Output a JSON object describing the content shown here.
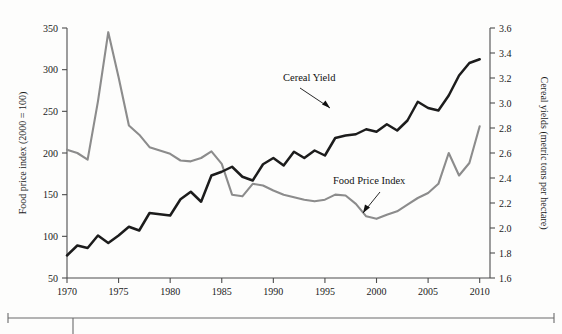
{
  "chart_data": {
    "type": "line",
    "title": "",
    "xlabel": "",
    "grid": false,
    "legend_position": "inline-annotations",
    "x": [
      1970,
      1971,
      1972,
      1973,
      1974,
      1975,
      1976,
      1977,
      1978,
      1979,
      1980,
      1981,
      1982,
      1983,
      1984,
      1985,
      1986,
      1987,
      1988,
      1989,
      1990,
      1991,
      1992,
      1993,
      1994,
      1995,
      1996,
      1997,
      1998,
      1999,
      2000,
      2001,
      2002,
      2003,
      2004,
      2005,
      2006,
      2007,
      2008,
      2009,
      2010
    ],
    "xlim": [
      1970,
      2011
    ],
    "xticks": [
      1970,
      1975,
      1980,
      1985,
      1990,
      1995,
      2000,
      2005,
      2010
    ],
    "left_axis": {
      "label": "Food price index (2000 = 100)",
      "ticks": [
        50,
        100,
        150,
        200,
        250,
        300,
        350
      ],
      "lim": [
        50,
        350
      ]
    },
    "right_axis": {
      "label": "Cereal yields (metric tons per hectare)",
      "ticks": [
        "1.6",
        "1.8",
        "2.0",
        "2.2",
        "2.4",
        "2.6",
        "2.8",
        "3.0",
        "3.2",
        "3.4",
        "3.6"
      ],
      "lim": [
        1.6,
        3.6
      ]
    },
    "series": [
      {
        "name": "Food Price Index",
        "axis": "left",
        "color": "#8c8c8c",
        "values": [
          204,
          200,
          192,
          262,
          345,
          291,
          233,
          222,
          207,
          203,
          199,
          191,
          190,
          194,
          202,
          187,
          150,
          148,
          163,
          161,
          155,
          150,
          147,
          144,
          142,
          144,
          150,
          149,
          139,
          124,
          121,
          126,
          130,
          138,
          146,
          152,
          163,
          200,
          173,
          188,
          232
        ]
      },
      {
        "name": "Cereal Yield",
        "axis": "right",
        "color": "#1c1c1c",
        "values": [
          1.78,
          1.86,
          1.84,
          1.94,
          1.88,
          1.94,
          2.01,
          1.98,
          2.12,
          2.11,
          2.1,
          2.23,
          2.29,
          2.21,
          2.42,
          2.45,
          2.49,
          2.41,
          2.38,
          2.51,
          2.56,
          2.5,
          2.61,
          2.56,
          2.62,
          2.58,
          2.72,
          2.74,
          2.75,
          2.79,
          2.77,
          2.83,
          2.78,
          2.86,
          3.01,
          2.96,
          2.94,
          3.06,
          3.22,
          3.32,
          3.35
        ]
      }
    ],
    "annotations": [
      {
        "name": "cereal-yield-annotation",
        "text": "Cereal Yield"
      },
      {
        "name": "food-price-index-annotation",
        "text": "Food Price Index"
      }
    ]
  },
  "labels": {
    "left_axis_title": "Food price index (2000 = 100)",
    "right_axis_title": "Cereal yields (metric tons per hectare)",
    "cereal_yield": "Cereal Yield",
    "food_price_index": "Food Price Index"
  }
}
